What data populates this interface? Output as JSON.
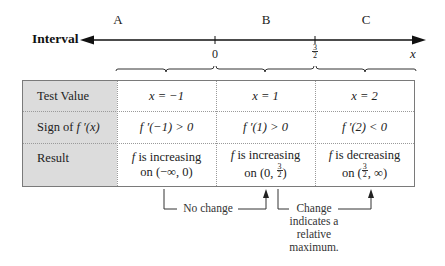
{
  "number_line": {
    "label": "Interval",
    "regions": [
      "A",
      "B",
      "C"
    ],
    "ticks": [
      {
        "label": "0"
      },
      {
        "numerator": "3",
        "denominator": "2"
      }
    ],
    "axis_variable": "x"
  },
  "table": {
    "columns": [
      "",
      "A",
      "B",
      "C"
    ],
    "rows": [
      {
        "header": "Test Value",
        "cells": [
          "x = −1",
          "x = 1",
          "x = 2"
        ]
      },
      {
        "header_prefix": "Sign of ",
        "header_fn": "f ′(x)",
        "cells": [
          "f ′(−1) > 0",
          "f ′(1) > 0",
          "f ′(2) < 0"
        ]
      },
      {
        "header": "Result",
        "cells": [
          {
            "line1_fn": "f",
            "line1": " is increasing",
            "line2": "on (−∞, 0)"
          },
          {
            "line1_fn": "f",
            "line1": " is increasing",
            "line2_prefix": "on (0, ",
            "line2_num": "3",
            "line2_den": "2",
            "line2_suffix": ")"
          },
          {
            "line1_fn": "f",
            "line1": " is decreasing",
            "line2_prefix": "on (",
            "line2_num": "3",
            "line2_den": "2",
            "line2_suffix": ", ∞)"
          }
        ]
      }
    ]
  },
  "annotations": {
    "no_change": "No change",
    "change_line1": "Change",
    "change_line2": "indicates a",
    "change_line3": "relative",
    "change_line4": "maximum."
  },
  "colors": {
    "header_bg": "#dcdcdc",
    "border": "#7a7a7a",
    "line": "#222222"
  }
}
